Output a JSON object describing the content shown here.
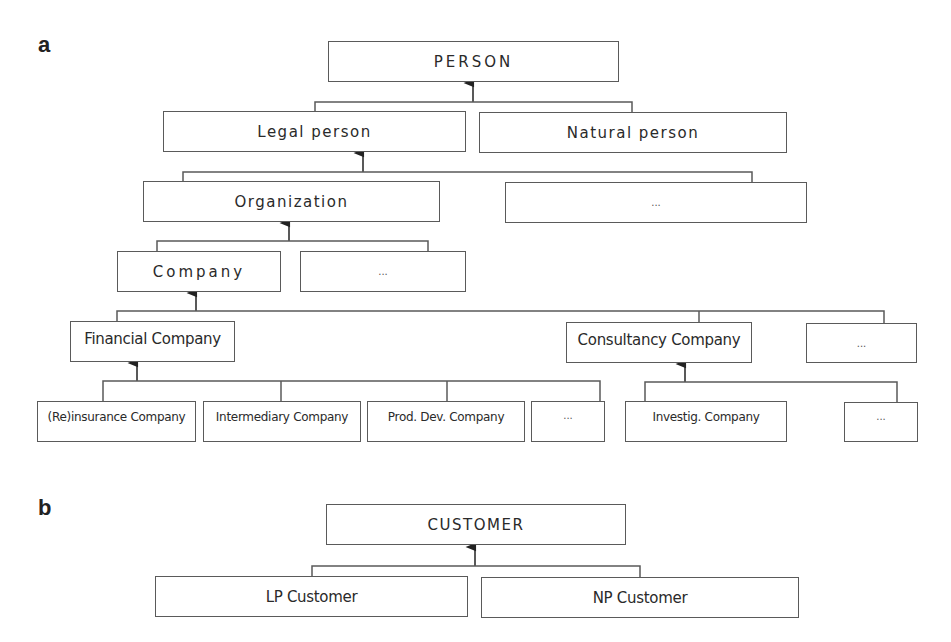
{
  "panels": {
    "a": {
      "label": "a",
      "nodes": {
        "person": "PERSON",
        "legal_person": "Legal person",
        "natural_person": "Natural person",
        "organization": "Organization",
        "legal_other": "...",
        "company": "Company",
        "organization_other": "...",
        "financial_company": "Financial Company",
        "consultancy_company": "Consultancy Company",
        "company_other": "...",
        "reinsurance_company": "(Re)insurance Company",
        "intermediary_company": "Intermediary Company",
        "prod_dev_company": "Prod. Dev. Company",
        "financial_other": "...",
        "investig_company": "Investig. Company",
        "consultancy_other": "..."
      }
    },
    "b": {
      "label": "b",
      "nodes": {
        "customer": "CUSTOMER",
        "lp_customer": "LP Customer",
        "np_customer": "NP Customer"
      }
    }
  },
  "edges": [
    {
      "from": "legal_person",
      "to": "person"
    },
    {
      "from": "natural_person",
      "to": "person"
    },
    {
      "from": "organization",
      "to": "legal_person"
    },
    {
      "from": "legal_other",
      "to": "legal_person"
    },
    {
      "from": "company",
      "to": "organization"
    },
    {
      "from": "organization_other",
      "to": "organization"
    },
    {
      "from": "financial_company",
      "to": "company"
    },
    {
      "from": "consultancy_company",
      "to": "company"
    },
    {
      "from": "company_other",
      "to": "company"
    },
    {
      "from": "reinsurance_company",
      "to": "financial_company"
    },
    {
      "from": "intermediary_company",
      "to": "financial_company"
    },
    {
      "from": "prod_dev_company",
      "to": "financial_company"
    },
    {
      "from": "financial_other",
      "to": "financial_company"
    },
    {
      "from": "investig_company",
      "to": "consultancy_company"
    },
    {
      "from": "consultancy_other",
      "to": "consultancy_company"
    },
    {
      "from": "lp_customer",
      "to": "customer"
    },
    {
      "from": "np_customer",
      "to": "customer"
    }
  ],
  "colors": {
    "line": "#5a5a5a",
    "text": "#2a2a2a",
    "background": "#ffffff"
  }
}
